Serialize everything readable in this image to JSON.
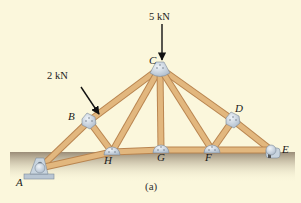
{
  "figure": {
    "caption": "(a)",
    "type": "roof truss"
  },
  "joints": [
    {
      "id": "A",
      "label": "A",
      "support": "pin"
    },
    {
      "id": "B",
      "label": "B"
    },
    {
      "id": "C",
      "label": "C"
    },
    {
      "id": "D",
      "label": "D"
    },
    {
      "id": "E",
      "label": "E",
      "support": "roller"
    },
    {
      "id": "F",
      "label": "F"
    },
    {
      "id": "G",
      "label": "G"
    },
    {
      "id": "H",
      "label": "H"
    }
  ],
  "members": [
    [
      "A",
      "B"
    ],
    [
      "B",
      "C"
    ],
    [
      "C",
      "D"
    ],
    [
      "D",
      "E"
    ],
    [
      "A",
      "H"
    ],
    [
      "H",
      "G"
    ],
    [
      "G",
      "F"
    ],
    [
      "F",
      "E"
    ],
    [
      "B",
      "H"
    ],
    [
      "H",
      "C"
    ],
    [
      "C",
      "G"
    ],
    [
      "C",
      "F"
    ],
    [
      "F",
      "D"
    ]
  ],
  "loads": [
    {
      "joint": "B",
      "label": "2 kN",
      "direction": "inclined, normal to top chord"
    },
    {
      "joint": "C",
      "label": "5 kN",
      "direction": "vertical downward"
    }
  ],
  "colors": {
    "background": "#fbf7dc",
    "wood": "#e2b77e",
    "wood_dark": "#b98550",
    "gusset": "#c9d6e3",
    "ground": "#8a7a66"
  }
}
